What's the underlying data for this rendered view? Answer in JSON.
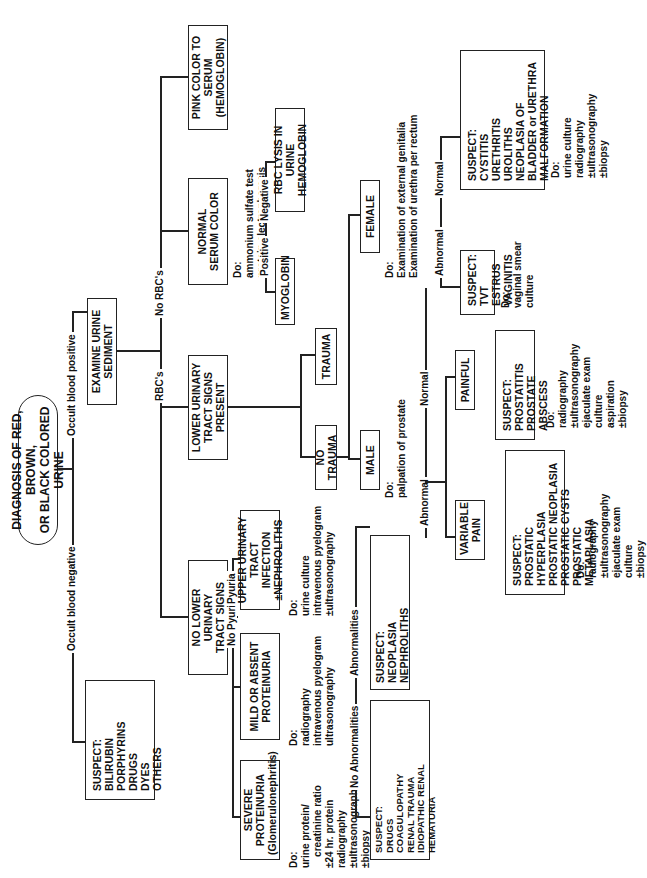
{
  "title": [
    "DIAGNOSIS OF RED, BROWN,",
    "OR BLACK COLORED URINE"
  ],
  "edges": {
    "occult_negative": "Occult blood negative",
    "occult_positive": "Occult blood positive",
    "rbcs": "RBC's",
    "no_rbcs": "No RBC's",
    "positive": "Positive",
    "negative": "Negative",
    "pyuria": "Pyuria",
    "no_pyuria": "No Pyuria",
    "abnormalities": "Abnormalities",
    "no_abnormalities": "No Abnormalities",
    "normal_prostate": "Normal",
    "abnormal_prostate": "Abnormal",
    "normal_female": "Normal",
    "abnormal_female": "Abnormal"
  },
  "nodes": {
    "suspect_pigments": [
      "SUSPECT:",
      "BILIRUBIN",
      "PORPHYRINS",
      "DRUGS",
      "DYES",
      "OTHERS"
    ],
    "examine_sediment": [
      "EXAMINE URINE",
      "SEDIMENT"
    ],
    "pink_serum": [
      "PINK COLOR TO",
      "SERUM",
      "(HEMOGLOBIN)"
    ],
    "normal_serum": [
      "NORMAL",
      "SERUM COLOR"
    ],
    "lower_present": [
      "LOWER URINARY",
      "TRACT SIGNS",
      "PRESENT"
    ],
    "no_lower": [
      "NO LOWER URINARY",
      "TRACT SIGNS"
    ],
    "myoglobin": [
      "MYOGLOBIN"
    ],
    "rbc_lysis": [
      "RBC LYSIS IN URINE",
      "HEMOGLOBIN"
    ],
    "trauma": [
      "TRAUMA"
    ],
    "no_trauma": [
      "NO TRAUMA"
    ],
    "male": [
      "MALE"
    ],
    "female": [
      "FEMALE"
    ],
    "upper_infection": [
      "UPPER URINARY",
      "TRACT INFECTION",
      "±NEPHROLITHS"
    ],
    "mild_proteinuria": [
      "MILD OR ABSENT",
      "PROTEINURIA"
    ],
    "severe_proteinuria": [
      "SEVERE",
      "PROTEINURIA",
      "(Glomerulonephritis)"
    ],
    "suspect_neoplasia": [
      "SUSPECT:",
      "NEOPLASIA",
      "NEPHROLITHS",
      "URETEROLITHS",
      "±CYSTIC RENAL DISEASE"
    ],
    "suspect_drugs": [
      "SUSPECT:",
      "DRUGS",
      "COAGULOPATHY",
      "RENAL TRAUMA",
      "IDIOPATHIC RENAL HEMATURIA",
      "TELANGIECTASIA OF WELSH",
      "    CORGIS",
      "VASCULAR DISEASE"
    ],
    "painful": [
      "PAINFUL"
    ],
    "variable_pain": [
      "VARIABLE",
      "PAIN"
    ],
    "suspect_prostatitis": [
      "SUSPECT:",
      "PROSTATITIS",
      "PROSTATE ABSCESS"
    ],
    "suspect_hyperplasia": [
      "SUSPECT:",
      "PROSTATIC HYPERPLASIA",
      "PROSTATIC NEOPLASIA",
      "PROSTATIC CYSTS",
      "PROSTATIC METAPLASIA"
    ],
    "suspect_tvt": [
      "SUSPECT:",
      "TVT",
      "ESTRUS",
      "VAGINITIS"
    ],
    "suspect_cystitis": [
      "SUSPECT:",
      "CYSTITIS",
      "URETHRITIS",
      "UROLITHS",
      "NEOPLASIA OF",
      "    BLADDER or URETHRA",
      "MALFORMATION"
    ]
  },
  "do": {
    "serum": "Do:\nammonium sulfate test\nprotein electrophoresis",
    "upper": "Do:\nurine culture\nintravenous pyelogram\n±ultrasonography",
    "mild": "Do:\nradiography\nintravenous pyelogram\nultrasonography",
    "severe": "Do:\nurine protein/\n    creatinine ratio\n±24 hr. protein\nradiography\n±ultrasonography\n±biopsy",
    "male": "Do:\npalpation of prostate",
    "female": "Do:\nExamination of external genitalia\nExamination of urethra per rectum",
    "painful": "Do:\nradiography\n±ultrasonography\nejaculate exam\nculture\naspiration\n±biopsy",
    "variable": "Do:\nradiography\n±ultrasonography\nejaculate exam\nculture\n±biopsy",
    "tvt": "Do:\nvaginal smear\nculture",
    "cystitis": "Do:\nurine culture\nradiography\n±ultrasonography\n±biopsy"
  }
}
